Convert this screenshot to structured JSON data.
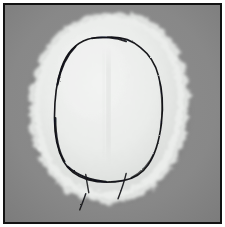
{
  "figure": {
    "kind": "photograph",
    "orientation": "portrait",
    "width_px": 225,
    "height_px": 227,
    "caption": "",
    "frame": {
      "border_color": "#121212",
      "border_width_px": 2,
      "margin_color": "#ffffff",
      "margin_px": 3
    },
    "palette": {
      "background_gray": "#868686",
      "background_gray_dark": "#7b7b7b",
      "background_gray_light": "#919191",
      "fabric_white": "#eef0ef",
      "fabric_white_shadow": "#dcdedd",
      "fabric_fuzz_edge": "#cfd1d0",
      "ink_black": "#15161a",
      "seam_gray": "#e2e4e3"
    },
    "subject": {
      "name": "fleece cap blank",
      "description": "soft white fuzzy-edged fabric oval",
      "bounds": {
        "x": 28,
        "y": 14,
        "w": 160,
        "h": 188
      }
    },
    "markings": [
      {
        "name": "drawn-outline",
        "type": "closed-curve",
        "color": "#15161a",
        "stroke_px": 1.6,
        "bounds": {
          "x": 64,
          "y": 41,
          "w": 99,
          "h": 139
        }
      },
      {
        "name": "tail-stroke-left",
        "type": "open-stroke",
        "color": "#15161a",
        "stroke_px": 1.4
      },
      {
        "name": "tail-stroke-right",
        "type": "open-stroke",
        "color": "#15161a",
        "stroke_px": 1.4
      },
      {
        "name": "tail-stroke-lower",
        "type": "open-stroke",
        "color": "#15161a",
        "stroke_px": 1.4
      }
    ]
  }
}
